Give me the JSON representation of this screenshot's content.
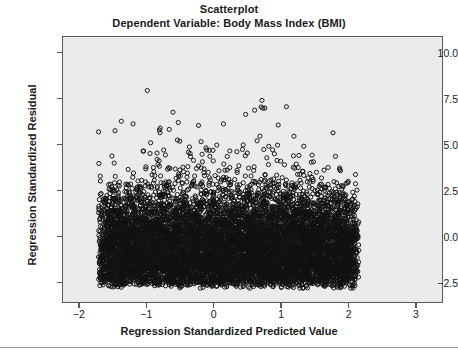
{
  "chart_data": {
    "type": "scatter",
    "title": "Scatterplot",
    "subtitle": "Dependent Variable: Body Mass Index (BMI)",
    "xlabel": "Regression Standardized Predicted Value",
    "ylabel": "Regression Standardized Residual",
    "xlim": [
      -2.25,
      3.4
    ],
    "ylim": [
      -3.6,
      10.9
    ],
    "xticks": [
      "-2",
      "-1",
      "0",
      "1",
      "2",
      "3"
    ],
    "xtick_values": [
      -2,
      -1,
      0,
      1,
      2,
      3
    ],
    "yticks": [
      "10.0",
      "7.5",
      "5.0",
      "2.5",
      "0.0",
      "-2.5"
    ],
    "ytick_values": [
      10.0,
      7.5,
      5.0,
      2.5,
      0.0,
      -2.5
    ],
    "grid": false,
    "legend": "none",
    "marker": "open-circle",
    "marker_size_px": 4.2,
    "marker_color": "#111111",
    "panel_background": "#ebebeb",
    "frame_color": "#585858",
    "n_points_approx": 9000,
    "data_x_range": [
      -1.72,
      2.16
    ],
    "data_y_range": [
      -2.85,
      8.55
    ],
    "series": [
      {
        "name": "Residuals",
        "density_bands": [
          {
            "y_center": -2.4,
            "relative_density": 0.62
          },
          {
            "y_center": -1.6,
            "relative_density": 1.0
          },
          {
            "y_center": -0.8,
            "relative_density": 0.97
          },
          {
            "y_center": 0.0,
            "relative_density": 0.86
          },
          {
            "y_center": 0.8,
            "relative_density": 0.62
          },
          {
            "y_center": 1.6,
            "relative_density": 0.38
          },
          {
            "y_center": 2.4,
            "relative_density": 0.19
          },
          {
            "y_center": 3.2,
            "relative_density": 0.09
          },
          {
            "y_center": 4.0,
            "relative_density": 0.04
          },
          {
            "y_center": 5.0,
            "relative_density": 0.018
          },
          {
            "y_center": 6.0,
            "relative_density": 0.008
          },
          {
            "y_center": 7.0,
            "relative_density": 0.003
          },
          {
            "y_center": 8.2,
            "relative_density": 0.001
          }
        ]
      }
    ]
  }
}
